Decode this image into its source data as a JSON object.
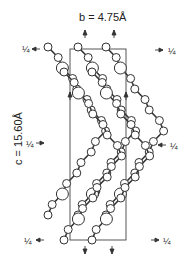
{
  "figure": {
    "b_axis_label": "b = 4.75Å",
    "c_axis_label": "c = 15.60Å",
    "symmetry_fraction": "¼",
    "fraction_markers": [
      {
        "position": "top-left",
        "text": "¼"
      },
      {
        "position": "top-right",
        "text": "¼"
      },
      {
        "position": "middle-left",
        "text": "¼"
      },
      {
        "position": "middle-right",
        "text": "¼"
      },
      {
        "position": "bottom-left",
        "text": "¼"
      },
      {
        "position": "bottom-right",
        "text": "¼"
      }
    ]
  }
}
